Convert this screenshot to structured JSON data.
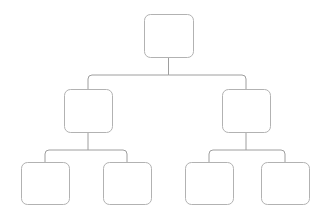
{
  "diagram": {
    "type": "tree",
    "shape": "rounded-rectangle",
    "orientation": "top-down",
    "depth": 3,
    "node_count": 7,
    "background_color": "#ffffff",
    "node_fill_color": "#ffffff",
    "node_stroke_color": "#b2b2b2",
    "connector_stroke_color": "#9e9e9e",
    "stroke_width": 1,
    "corner_radius": 6,
    "nodes": [
      {
        "id": "root",
        "label": "",
        "level": 0,
        "x": 144,
        "y": 14,
        "width": 49,
        "height": 43
      },
      {
        "id": "l2a",
        "label": "",
        "level": 1,
        "x": 64,
        "y": 89,
        "width": 48,
        "height": 43
      },
      {
        "id": "l2b",
        "label": "",
        "level": 1,
        "x": 222,
        "y": 89,
        "width": 48,
        "height": 43
      },
      {
        "id": "l3a",
        "label": "",
        "level": 2,
        "x": 21,
        "y": 162,
        "width": 48,
        "height": 42
      },
      {
        "id": "l3b",
        "label": "",
        "level": 2,
        "x": 103,
        "y": 162,
        "width": 48,
        "height": 42
      },
      {
        "id": "l3c",
        "label": "",
        "level": 2,
        "x": 185,
        "y": 162,
        "width": 48,
        "height": 42
      },
      {
        "id": "l3d",
        "label": "",
        "level": 2,
        "x": 261,
        "y": 162,
        "width": 48,
        "height": 42
      }
    ],
    "edges": [
      {
        "from": "root",
        "to": "l2a"
      },
      {
        "from": "root",
        "to": "l2b"
      },
      {
        "from": "l2a",
        "to": "l3a"
      },
      {
        "from": "l2a",
        "to": "l3b"
      },
      {
        "from": "l2b",
        "to": "l3c"
      },
      {
        "from": "l2b",
        "to": "l3d"
      }
    ],
    "connector_paths": {
      "root_stem": "M 168.5 57 L 168.5 75",
      "top_bus_left": "M 168.5 75 L 92 75 Q 88 75 88 79 L 88 89",
      "top_bus_right": "M 168.5 75 L 242 75 Q 246 75 246 79 L 246 89",
      "l2a_stem": "M 88 132 L 88 150",
      "l2a_bus_left": "M 88 150 L 49 150 Q 45 150 45 154 L 45 162",
      "l2a_bus_right": "M 88 150 L 123 150 Q 127 150 127 154 L 127 162",
      "l2b_stem": "M 246 132 L 246 150",
      "l2b_bus_left": "M 246 150 L 213 150 Q 209 150 209 154 L 209 162",
      "l2b_bus_right": "M 246 150 L 281 150 Q 285 150 285 154 L 285 162"
    }
  }
}
